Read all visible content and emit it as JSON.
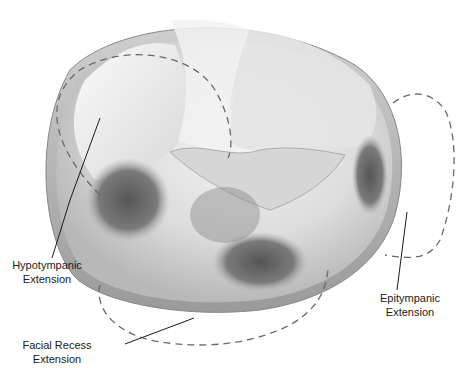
{
  "figure": {
    "colors": {
      "background": "#ffffff",
      "outline_dash": "#6a6a6a",
      "leader_line": "#1a1a1a",
      "shade_dark": "#5a5a5a",
      "shade_light": "#e8e8e8"
    },
    "labels": [
      {
        "id": "hypotympanic",
        "line1": "Hypotympanic",
        "line2": "Extension"
      },
      {
        "id": "epitympanic",
        "line1": "Epitympanic",
        "line2": "Extension"
      },
      {
        "id": "facial_recess",
        "line1": "Facial Recess",
        "line2": "Extension"
      }
    ]
  }
}
